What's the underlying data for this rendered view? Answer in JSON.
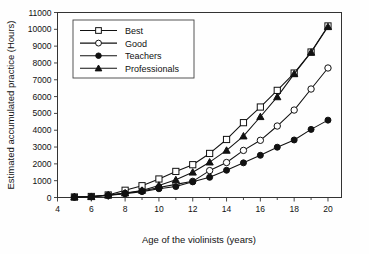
{
  "chart_data": {
    "type": "line",
    "title": "",
    "xlabel": "Age of the violinists (years)",
    "ylabel": "Estimated accumulated practice (Hours)",
    "xlim": [
      4,
      20.8
    ],
    "ylim": [
      0,
      11000
    ],
    "grid": false,
    "legend_position": "upper-left-inside",
    "x_ticks": [
      4,
      6,
      8,
      10,
      12,
      14,
      16,
      18,
      20
    ],
    "x_tick_labels": [
      "4",
      "6",
      "8",
      "10",
      "12",
      "14",
      "16",
      "18",
      "20"
    ],
    "x_minor_ticks": [
      5,
      7,
      9,
      11,
      13,
      15,
      17,
      19
    ],
    "y_ticks": [
      0,
      1000,
      2000,
      3000,
      4000,
      5000,
      6000,
      7000,
      8000,
      9000,
      10000,
      11000
    ],
    "y_tick_labels": [
      "0",
      "1000",
      "2000",
      "3000",
      "4000",
      "5000",
      "6000",
      "7000",
      "8000",
      "9000",
      "10000",
      "11000"
    ],
    "x": [
      5,
      6,
      7,
      8,
      9,
      10,
      11,
      12,
      13,
      14,
      15,
      16,
      17,
      18,
      19,
      20
    ],
    "series": [
      {
        "name": "Best",
        "marker": "open-square",
        "values": [
          30,
          60,
          150,
          430,
          700,
          1100,
          1550,
          1950,
          2620,
          3450,
          4450,
          5380,
          6370,
          7400,
          8650,
          10200
        ]
      },
      {
        "name": "Good",
        "marker": "open-circle",
        "values": [
          25,
          50,
          130,
          250,
          390,
          600,
          780,
          960,
          1600,
          2080,
          2800,
          3400,
          4250,
          5200,
          6450,
          7700
        ]
      },
      {
        "name": "Teachers",
        "marker": "filled-circle",
        "values": [
          20,
          40,
          120,
          230,
          350,
          520,
          650,
          930,
          1200,
          1620,
          2060,
          2510,
          2990,
          3420,
          4050,
          4600
        ]
      },
      {
        "name": "Professionals",
        "marker": "filled-triangle",
        "values": [
          28,
          55,
          145,
          260,
          420,
          720,
          1050,
          1500,
          2100,
          2800,
          3650,
          4800,
          5980,
          7350,
          8630,
          10150
        ]
      }
    ]
  },
  "legend": {
    "entries": [
      {
        "label": "Best"
      },
      {
        "label": "Good"
      },
      {
        "label": "Teachers"
      },
      {
        "label": "Professionals"
      }
    ]
  }
}
